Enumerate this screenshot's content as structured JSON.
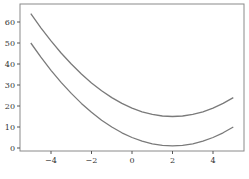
{
  "chart_data": {
    "type": "line",
    "title": "",
    "xlabel": "",
    "ylabel": "",
    "xlim": [
      -5.5,
      5.5
    ],
    "ylim": [
      -2,
      68
    ],
    "grid": false,
    "legend": null,
    "x_ticks": [
      -4,
      -2,
      0,
      2,
      4
    ],
    "x_tick_labels": [
      "−4",
      "−2",
      "0",
      "2",
      "4"
    ],
    "y_ticks": [
      0,
      10,
      20,
      30,
      40,
      50,
      60
    ],
    "y_tick_labels": [
      "0",
      "10",
      "20",
      "30",
      "40",
      "50",
      "60"
    ],
    "x": [
      -5,
      -4.5,
      -4,
      -3.5,
      -3,
      -2.5,
      -2,
      -1.5,
      -1,
      -0.5,
      0,
      0.5,
      1,
      1.5,
      2,
      2.5,
      3,
      3.5,
      4,
      4.5,
      5
    ],
    "series": [
      {
        "name": "upper curve",
        "color": "#7a7a7a",
        "values": [
          64,
          57.25,
          51,
          45.25,
          40,
          35.25,
          31,
          27.25,
          24,
          21.25,
          19,
          17.25,
          16,
          15.25,
          15,
          15.25,
          16,
          17.25,
          19,
          21.25,
          24
        ]
      },
      {
        "name": "lower curve",
        "color": "#7a7a7a",
        "values": [
          50,
          43.25,
          37,
          31.25,
          26,
          21.25,
          17,
          13.25,
          10,
          7.25,
          5,
          3.25,
          2,
          1.25,
          1,
          1.25,
          2,
          3.25,
          5,
          7.25,
          10
        ]
      }
    ]
  }
}
